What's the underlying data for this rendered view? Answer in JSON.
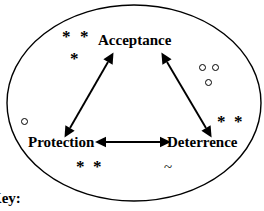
{
  "diagram": {
    "type": "triangle-relationship",
    "boundary_shape": "ellipse",
    "nodes": [
      {
        "id": "acceptance",
        "label": "Acceptance",
        "position": "top-center"
      },
      {
        "id": "protection",
        "label": "Protection",
        "position": "bottom-left"
      },
      {
        "id": "deterrence",
        "label": "Deterrence",
        "position": "bottom-right"
      }
    ],
    "connectors": [
      {
        "from": "protection",
        "to": "acceptance",
        "style": "double-headed-arrow"
      },
      {
        "from": "acceptance",
        "to": "deterrence",
        "style": "double-headed-arrow"
      },
      {
        "from": "protection",
        "to": "deterrence",
        "style": "double-headed-arrow"
      }
    ],
    "markers": {
      "asterisk_clusters": [
        {
          "id": "top-left-cluster",
          "glyphs": [
            "*",
            "*",
            "*"
          ],
          "count": 3
        },
        {
          "id": "right-cluster",
          "glyphs": [
            "*",
            "*"
          ],
          "count": 2
        },
        {
          "id": "bottom-left-cluster",
          "glyphs": [
            "*",
            "*"
          ],
          "count": 2
        }
      ],
      "circle_clusters": [
        {
          "id": "right-circles",
          "count": 3
        },
        {
          "id": "left-circle",
          "count": 1
        }
      ],
      "tilde_markers": [
        {
          "id": "bottom-tilde",
          "glyph": "~"
        }
      ]
    },
    "key_caption": "Key:",
    "colors": {
      "stroke": "#000000",
      "background": "#ffffff",
      "text": "#000000"
    }
  }
}
